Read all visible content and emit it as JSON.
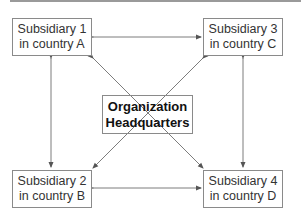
{
  "diagram": {
    "type": "organizational-network",
    "nodes": {
      "sub1": {
        "line1": "Subsidiary 1",
        "line2": "in country A"
      },
      "sub2": {
        "line1": "Subsidiary 2",
        "line2": "in country B"
      },
      "sub3": {
        "line1": "Subsidiary 3",
        "line2": "in country C"
      },
      "sub4": {
        "line1": "Subsidiary 4",
        "line2": "in country D"
      },
      "hq": {
        "line1": "Organization",
        "line2": "Headquarters"
      }
    },
    "edges": [
      {
        "from": "sub1",
        "to": "sub3",
        "bidirectional": true
      },
      {
        "from": "sub2",
        "to": "sub4",
        "bidirectional": true
      },
      {
        "from": "sub1",
        "to": "sub2",
        "bidirectional": true
      },
      {
        "from": "sub3",
        "to": "sub4",
        "bidirectional": true
      },
      {
        "from": "sub1",
        "to": "sub4",
        "bidirectional": true,
        "passes_through": "hq"
      },
      {
        "from": "sub3",
        "to": "sub2",
        "bidirectional": true,
        "passes_through": "hq"
      }
    ],
    "colors": {
      "line": "#6e6e6e",
      "border": "#8a8a8a",
      "text": "#333333"
    }
  }
}
